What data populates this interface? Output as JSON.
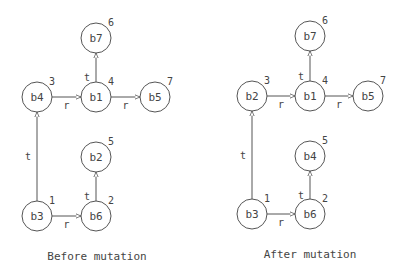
{
  "diagrams": [
    {
      "caption": "Before mutation",
      "caption_pos": [
        97,
        260
      ],
      "nodes": [
        {
          "id": "b4",
          "label": "b4",
          "order": "3",
          "x": 37,
          "y": 97
        },
        {
          "id": "b1",
          "label": "b1",
          "order": "4",
          "x": 96,
          "y": 97
        },
        {
          "id": "b5",
          "label": "b5",
          "order": "7",
          "x": 155,
          "y": 97
        },
        {
          "id": "b7",
          "label": "b7",
          "order": "6",
          "x": 96,
          "y": 38
        },
        {
          "id": "b2",
          "label": "b2",
          "order": "5",
          "x": 96,
          "y": 157
        },
        {
          "id": "b3",
          "label": "b3",
          "order": "1",
          "x": 37,
          "y": 216
        },
        {
          "id": "b6",
          "label": "b6",
          "order": "2",
          "x": 96,
          "y": 216
        }
      ],
      "edges": [
        {
          "from": "b4",
          "to": "b1",
          "label": "r"
        },
        {
          "from": "b1",
          "to": "b5",
          "label": "r"
        },
        {
          "from": "b1",
          "to": "b7",
          "label": "t"
        },
        {
          "from": "b3",
          "to": "b4",
          "label": "t"
        },
        {
          "from": "b3",
          "to": "b6",
          "label": "r"
        },
        {
          "from": "b6",
          "to": "b2",
          "label": "t"
        }
      ]
    },
    {
      "caption": "After mutation",
      "caption_pos": [
        310,
        258
      ],
      "nodes": [
        {
          "id": "b2",
          "label": "b2",
          "order": "3",
          "x": 252,
          "y": 96
        },
        {
          "id": "b1",
          "label": "b1",
          "order": "4",
          "x": 310,
          "y": 96
        },
        {
          "id": "b5",
          "label": "b5",
          "order": "7",
          "x": 368,
          "y": 96
        },
        {
          "id": "b7",
          "label": "b7",
          "order": "6",
          "x": 310,
          "y": 36
        },
        {
          "id": "b4",
          "label": "b4",
          "order": "5",
          "x": 310,
          "y": 156
        },
        {
          "id": "b3",
          "label": "b3",
          "order": "1",
          "x": 252,
          "y": 214
        },
        {
          "id": "b6",
          "label": "b6",
          "order": "2",
          "x": 310,
          "y": 214
        }
      ],
      "edges": [
        {
          "from": "b2",
          "to": "b1",
          "label": "r"
        },
        {
          "from": "b1",
          "to": "b5",
          "label": "r"
        },
        {
          "from": "b1",
          "to": "b7",
          "label": "t"
        },
        {
          "from": "b3",
          "to": "b2",
          "label": "t"
        },
        {
          "from": "b3",
          "to": "b6",
          "label": "r"
        },
        {
          "from": "b6",
          "to": "b4",
          "label": "t"
        }
      ]
    }
  ],
  "style": {
    "stroke": "#555555",
    "text": "#444444",
    "background": "#ffffff",
    "node_radius": 15
  }
}
